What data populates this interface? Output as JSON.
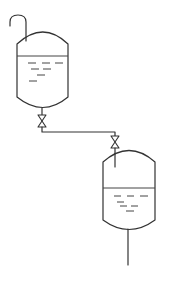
{
  "diagram": {
    "type": "process-flow",
    "stroke_color": "#333333",
    "background": "#ffffff",
    "components": [
      {
        "id": "inlet-hook-pipe",
        "kind": "pipe",
        "label": ""
      },
      {
        "id": "upper-tank",
        "kind": "vessel",
        "label": "",
        "has_liquid": true
      },
      {
        "id": "valve-1",
        "kind": "gate-valve",
        "label": ""
      },
      {
        "id": "connecting-pipe",
        "kind": "pipe",
        "label": ""
      },
      {
        "id": "valve-2",
        "kind": "gate-valve",
        "label": ""
      },
      {
        "id": "lower-tank",
        "kind": "vessel",
        "label": "",
        "has_liquid": true
      },
      {
        "id": "outlet-pipe",
        "kind": "pipe",
        "label": ""
      }
    ],
    "connections": [
      [
        "inlet-hook-pipe",
        "upper-tank"
      ],
      [
        "upper-tank",
        "valve-1"
      ],
      [
        "valve-1",
        "connecting-pipe"
      ],
      [
        "connecting-pipe",
        "valve-2"
      ],
      [
        "valve-2",
        "lower-tank"
      ],
      [
        "lower-tank",
        "outlet-pipe"
      ]
    ]
  }
}
